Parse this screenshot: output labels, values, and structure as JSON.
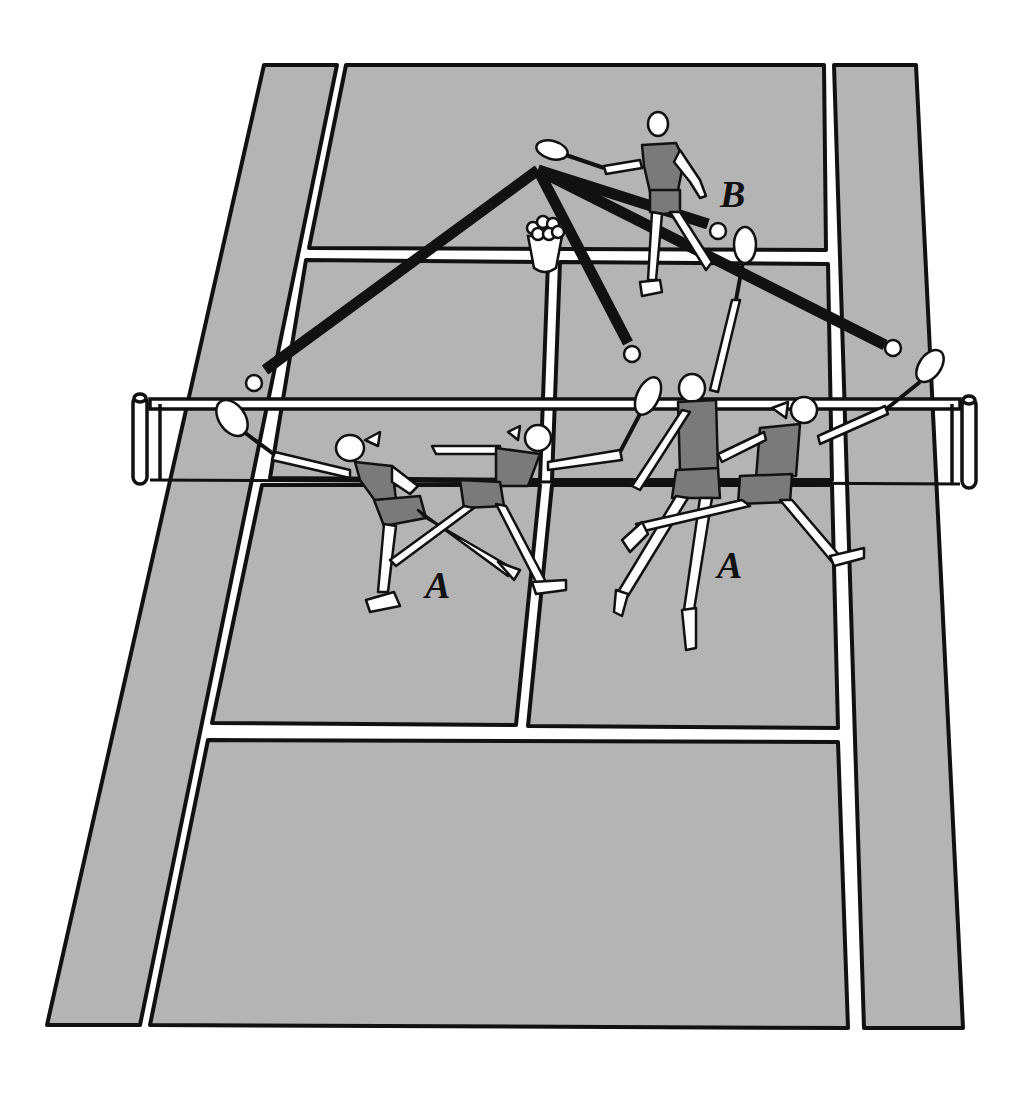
{
  "diagram": {
    "labels": {
      "feeder": "B",
      "player_left": "A",
      "player_right": "A"
    },
    "colors": {
      "court": "#b4b4b4",
      "lines": "#ffffff",
      "outline": "#111111",
      "shot_path": "#111111",
      "shirt": "#7a7a7a",
      "skin": "#ffffff"
    },
    "elements": {
      "feeder": "Player B feeding balls from behind the service line",
      "ball_basket": "Basket of balls",
      "net": "Tennis net with posts",
      "player_a_positions": 4,
      "shot_paths": 4
    }
  }
}
